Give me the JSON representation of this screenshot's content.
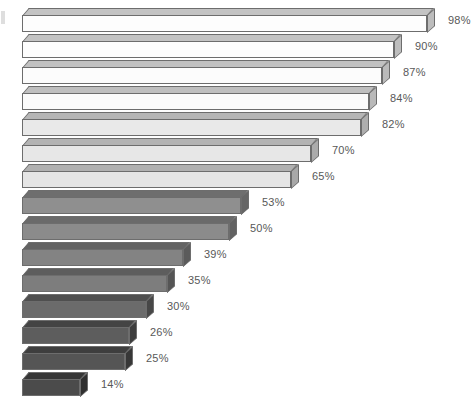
{
  "chart": {
    "type": "3d-horizontal-bar",
    "title": "",
    "background_color": "#ffffff",
    "label_color": "#585858",
    "edge_color": "#6d6d6d",
    "value_suffix": "%"
  },
  "chart_data": {
    "type": "bar",
    "orientation": "horizontal",
    "title": "",
    "subtitle": "",
    "xlabel": "",
    "ylabel": "",
    "xlim": [
      0,
      100
    ],
    "grid": false,
    "legend": null,
    "categories": [
      "1",
      "2",
      "3",
      "4",
      "5",
      "6",
      "7",
      "8",
      "9",
      "10",
      "11",
      "12",
      "13",
      "14",
      "15"
    ],
    "values": [
      98,
      90,
      87,
      84,
      82,
      70,
      65,
      53,
      50,
      39,
      35,
      30,
      26,
      25,
      14
    ],
    "data_labels": [
      "98%",
      "90%",
      "87%",
      "84%",
      "82%",
      "70%",
      "65%",
      "53%",
      "50%",
      "39%",
      "35%",
      "30%",
      "26%",
      "25%",
      "14%"
    ],
    "tick_labels": [],
    "annotations": []
  },
  "bars": [
    {
      "label": "98%",
      "value": 98,
      "front": "#fdfdfd",
      "top": "#c3c3c3",
      "side": "#bdbdbd"
    },
    {
      "label": "90%",
      "value": 90,
      "front": "#fdfdfd",
      "top": "#c3c3c3",
      "side": "#bdbdbd"
    },
    {
      "label": "87%",
      "value": 87,
      "front": "#fcfcfc",
      "top": "#c1c1c1",
      "side": "#bbbbbb"
    },
    {
      "label": "84%",
      "value": 84,
      "front": "#fbfbfb",
      "top": "#bfbfbf",
      "side": "#b9b9b9"
    },
    {
      "label": "82%",
      "value": 82,
      "front": "#e9e9e9",
      "top": "#b6b6b6",
      "side": "#aeaeae"
    },
    {
      "label": "70%",
      "value": 70,
      "front": "#e7e7e7",
      "top": "#b3b3b3",
      "side": "#ababab"
    },
    {
      "label": "65%",
      "value": 65,
      "front": "#e5e5e5",
      "top": "#b0b0b0",
      "side": "#a8a8a8"
    },
    {
      "label": "53%",
      "value": 53,
      "front": "#8f8f8f",
      "top": "#6e6e6e",
      "side": "#666666"
    },
    {
      "label": "50%",
      "value": 50,
      "front": "#8b8b8b",
      "top": "#6a6a6a",
      "side": "#626262"
    },
    {
      "label": "39%",
      "value": 39,
      "front": "#838383",
      "top": "#636363",
      "side": "#5b5b5b"
    },
    {
      "label": "35%",
      "value": 35,
      "front": "#7d7d7d",
      "top": "#5d5d5d",
      "side": "#555555"
    },
    {
      "label": "30%",
      "value": 30,
      "front": "#6b6b6b",
      "top": "#4f4f4f",
      "side": "#474747"
    },
    {
      "label": "26%",
      "value": 26,
      "front": "#5d5d5d",
      "top": "#444444",
      "side": "#3d3d3d"
    },
    {
      "label": "25%",
      "value": 25,
      "front": "#555555",
      "top": "#3e3e3e",
      "side": "#373737"
    },
    {
      "label": "14%",
      "value": 14,
      "front": "#4b4b4b",
      "top": "#363636",
      "side": "#2f2f2f"
    }
  ],
  "layout": {
    "plot_left": 22,
    "plot_top": 8,
    "row_height": 26,
    "bar_depth": 8,
    "max_bar_px": 405,
    "label_gap": 13
  }
}
